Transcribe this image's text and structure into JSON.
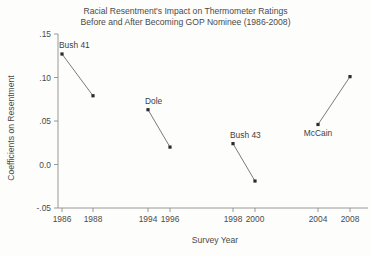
{
  "chart_data": {
    "type": "line",
    "title": "Racial Resentment's Impact on Thermometer Ratings",
    "subtitle": "Before and After Becoming GOP Nominee (1986-2008)",
    "title_lines": [
      "Racial Resentment's Impact on Thermometer Ratings",
      "Before and After Becoming GOP Nominee (1986-2008)"
    ],
    "xlabel": "Survey Year",
    "ylabel": "Coefficients on Resentment",
    "grid": false,
    "legend": "none",
    "xlim": [
      1985,
      2009
    ],
    "ylim": [
      -0.05,
      0.15
    ],
    "xticks": [
      1986,
      1988,
      1994,
      1996,
      1998,
      2000,
      2004,
      2008
    ],
    "xtick_labels": [
      "1986",
      "1988",
      "1994",
      "1996",
      "1998",
      "2000",
      "2004",
      "2008"
    ],
    "yticks": [
      0.15,
      0.1,
      0.05,
      0.0,
      -0.05
    ],
    "ytick_labels": [
      ".15",
      ".10",
      ".05",
      "0.0",
      "-.05"
    ],
    "series": [
      {
        "name": "Bush 41",
        "label": "Bush 41",
        "label_position": "above",
        "x": [
          1986,
          1988
        ],
        "x_labels": [
          "1986",
          "1988"
        ],
        "values": [
          0.127,
          0.079
        ]
      },
      {
        "name": "Dole",
        "label": "Dole",
        "label_position": "above",
        "x": [
          1994,
          1996
        ],
        "x_labels": [
          "1994",
          "1996"
        ],
        "values": [
          0.063,
          0.02
        ]
      },
      {
        "name": "Bush 43",
        "label": "Bush 43",
        "label_position": "above",
        "x": [
          1998,
          2000
        ],
        "x_labels": [
          "1998",
          "2000"
        ],
        "values": [
          0.024,
          -0.019
        ]
      },
      {
        "name": "McCain",
        "label": "McCain",
        "label_position": "below",
        "x": [
          2004,
          2008
        ],
        "x_labels": [
          "2004",
          "2008"
        ],
        "values": [
          0.046,
          0.101
        ]
      }
    ],
    "colors": {
      "line": "#6b6b6b",
      "point": "#2b2b2b",
      "axis": "#8d8d8d",
      "text": "#4a4a4a",
      "background": "#fdfdfc"
    }
  }
}
